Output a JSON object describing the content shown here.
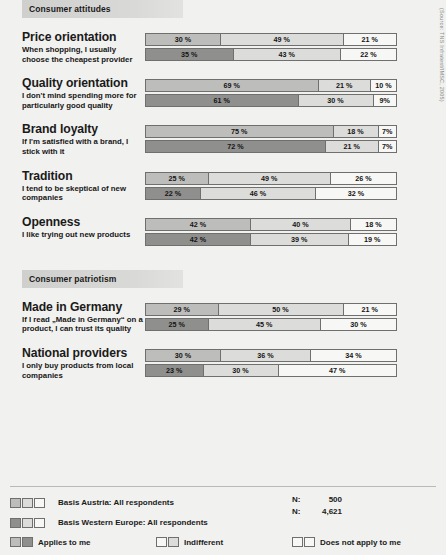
{
  "source_note": "(Source: TNS Infratest/IMSC, 2005)",
  "sections": [
    {
      "heading": "Consumer attitudes",
      "rows": [
        {
          "title": "Price orientation",
          "subtitle": "When shopping, I usually choose the cheapest provider",
          "austria": [
            {
              "label": "30 %",
              "value": 30
            },
            {
              "label": "49 %",
              "value": 49
            },
            {
              "label": "21 %",
              "value": 21
            }
          ],
          "western_europe": [
            {
              "label": "35 %",
              "value": 35
            },
            {
              "label": "43 %",
              "value": 43
            },
            {
              "label": "22 %",
              "value": 22
            }
          ]
        },
        {
          "title": "Quality orientation",
          "subtitle": "I don't mind spending more for particularly good quality",
          "austria": [
            {
              "label": "69 %",
              "value": 69
            },
            {
              "label": "21 %",
              "value": 21
            },
            {
              "label": "10 %",
              "value": 10
            }
          ],
          "western_europe": [
            {
              "label": "61 %",
              "value": 61
            },
            {
              "label": "30 %",
              "value": 30
            },
            {
              "label": "9%",
              "value": 9
            }
          ]
        },
        {
          "title": "Brand loyalty",
          "subtitle": "If I'm satisfied with a brand, I stick with it",
          "austria": [
            {
              "label": "75 %",
              "value": 75
            },
            {
              "label": "18 %",
              "value": 18
            },
            {
              "label": "7%",
              "value": 7
            }
          ],
          "western_europe": [
            {
              "label": "72 %",
              "value": 72
            },
            {
              "label": "21 %",
              "value": 21
            },
            {
              "label": "7%",
              "value": 7
            }
          ]
        },
        {
          "title": "Tradition",
          "subtitle": "I tend to be skeptical of new companies",
          "austria": [
            {
              "label": "25 %",
              "value": 25
            },
            {
              "label": "49 %",
              "value": 49
            },
            {
              "label": "26 %",
              "value": 26
            }
          ],
          "western_europe": [
            {
              "label": "22 %",
              "value": 22
            },
            {
              "label": "46 %",
              "value": 46
            },
            {
              "label": "32 %",
              "value": 32
            }
          ]
        },
        {
          "title": "Openness",
          "subtitle": "I like trying out new products",
          "austria": [
            {
              "label": "42 %",
              "value": 42
            },
            {
              "label": "40 %",
              "value": 40
            },
            {
              "label": "18 %",
              "value": 18
            }
          ],
          "western_europe": [
            {
              "label": "42 %",
              "value": 42
            },
            {
              "label": "39 %",
              "value": 39
            },
            {
              "label": "19 %",
              "value": 19
            }
          ]
        }
      ]
    },
    {
      "heading": "Consumer patriotism",
      "rows": [
        {
          "title": "Made in Germany",
          "subtitle": "If I read „Made in Germany“ on a product, I can trust its quality",
          "austria": [
            {
              "label": "29 %",
              "value": 29
            },
            {
              "label": "50 %",
              "value": 50
            },
            {
              "label": "21 %",
              "value": 21
            }
          ],
          "western_europe": [
            {
              "label": "25 %",
              "value": 25
            },
            {
              "label": "45 %",
              "value": 45
            },
            {
              "label": "30 %",
              "value": 30
            }
          ]
        },
        {
          "title": "National providers",
          "subtitle": "I only buy products from local companies",
          "austria": [
            {
              "label": "30 %",
              "value": 30
            },
            {
              "label": "36 %",
              "value": 36
            },
            {
              "label": "34 %",
              "value": 34
            }
          ],
          "western_europe": [
            {
              "label": "23 %",
              "value": 23
            },
            {
              "label": "30 %",
              "value": 30
            },
            {
              "label": "47 %",
              "value": 47
            }
          ]
        }
      ]
    }
  ],
  "legend": {
    "basis": [
      {
        "text": "Basis Austria: All respondents"
      },
      {
        "text": "Basis Western Europe: All respondents"
      }
    ],
    "n_values": [
      {
        "label": "N:",
        "value": "500"
      },
      {
        "label": "N:",
        "value": "4,621"
      }
    ],
    "keys": [
      {
        "text": "Applies to me"
      },
      {
        "text": "Indifferent"
      },
      {
        "text": "Does not apply to me"
      }
    ]
  },
  "colors": {
    "applies_austria": "#bdbdbb",
    "applies_western_europe": "#8f8f8d",
    "indifferent": "#dcdcda",
    "does_not_apply": "#f7f7f5",
    "band": "#d6d6d4",
    "border": "#6f6f6d",
    "background": "#f1f1ef"
  },
  "chart_data": {
    "type": "bar",
    "orientation": "horizontal",
    "stacked": true,
    "normalized_to": 100,
    "title": "",
    "xlabel": "",
    "ylabel": "",
    "xlim": [
      0,
      100
    ],
    "grid": false,
    "legend_position": "bottom",
    "categories": [
      "Price orientation",
      "Quality orientation",
      "Brand loyalty",
      "Tradition",
      "Openness",
      "Made in Germany",
      "National providers"
    ],
    "segment_names": [
      "Applies to me",
      "Indifferent",
      "Does not apply to me"
    ],
    "series": [
      {
        "name": "Basis Austria: All respondents",
        "n": 500,
        "values": [
          [
            30,
            49,
            21
          ],
          [
            69,
            21,
            10
          ],
          [
            75,
            18,
            7
          ],
          [
            25,
            49,
            26
          ],
          [
            42,
            40,
            18
          ],
          [
            29,
            50,
            21
          ],
          [
            30,
            36,
            34
          ]
        ]
      },
      {
        "name": "Basis Western Europe: All respondents",
        "n": 4621,
        "values": [
          [
            35,
            43,
            22
          ],
          [
            61,
            30,
            9
          ],
          [
            72,
            21,
            7
          ],
          [
            22,
            46,
            32
          ],
          [
            42,
            39,
            19
          ],
          [
            25,
            45,
            30
          ],
          [
            23,
            30,
            47
          ]
        ]
      }
    ]
  }
}
